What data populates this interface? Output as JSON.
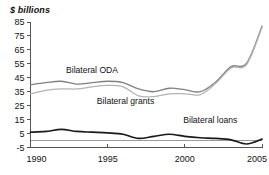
{
  "chart_data": {
    "type": "line",
    "title": "",
    "subtitle": "",
    "xlabel": "",
    "ylabel": "$ billions",
    "unit_label": "$ billions",
    "grid": false,
    "legend_position": "inline-annotations",
    "xlim": [
      1990,
      2005
    ],
    "ylim": [
      -5,
      85
    ],
    "x_ticks": [
      "1990",
      "1995",
      "2000",
      "2005"
    ],
    "x_tick_values": [
      1990,
      1995,
      2000,
      2005
    ],
    "y_ticks": [
      "85",
      "75",
      "65",
      "55",
      "45",
      "35",
      "25",
      "15",
      "5",
      "-5"
    ],
    "y_tick_values": [
      85,
      75,
      65,
      55,
      45,
      35,
      25,
      15,
      5,
      -5
    ],
    "x": [
      1990,
      1991,
      1992,
      1993,
      1994,
      1995,
      1996,
      1997,
      1998,
      1999,
      2000,
      2001,
      2002,
      2003,
      2004,
      2005
    ],
    "series": [
      {
        "name": "Bilateral ODA",
        "color": "#808080",
        "values": [
          40,
          41.5,
          42.5,
          40.5,
          41.5,
          42.5,
          41.5,
          37,
          35,
          37.5,
          36.5,
          35,
          42,
          53,
          55.5,
          82
        ]
      },
      {
        "name": "Bilateral grants",
        "color": "#b3b3b3",
        "values": [
          33.5,
          36,
          37,
          37,
          38.5,
          39.5,
          38.5,
          32,
          31.5,
          33.5,
          33.5,
          33,
          41,
          52,
          54.5,
          81
        ]
      },
      {
        "name": "Bilateral loans",
        "color": "#1a1a1a",
        "values": [
          6,
          6.5,
          8,
          6.5,
          6,
          5.5,
          4.5,
          1.5,
          3,
          4.5,
          3,
          2,
          1.5,
          0.5,
          -2.5,
          1
        ]
      }
    ],
    "annotations": [
      {
        "text": "Bilateral ODA",
        "x": 1992.3,
        "y": 48.5
      },
      {
        "text": "Bilateral grants",
        "x": 1994.3,
        "y": 26.5
      },
      {
        "text": "Bilateral loans",
        "x": 1999.9,
        "y": 12.5
      }
    ]
  }
}
